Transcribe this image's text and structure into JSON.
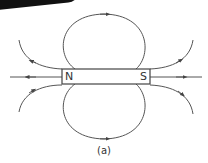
{
  "diagram": {
    "magnet": {
      "north_label": "N",
      "south_label": "S"
    },
    "caption": "(a)",
    "colors": {
      "line": "#444444",
      "background": "#ffffff"
    }
  }
}
